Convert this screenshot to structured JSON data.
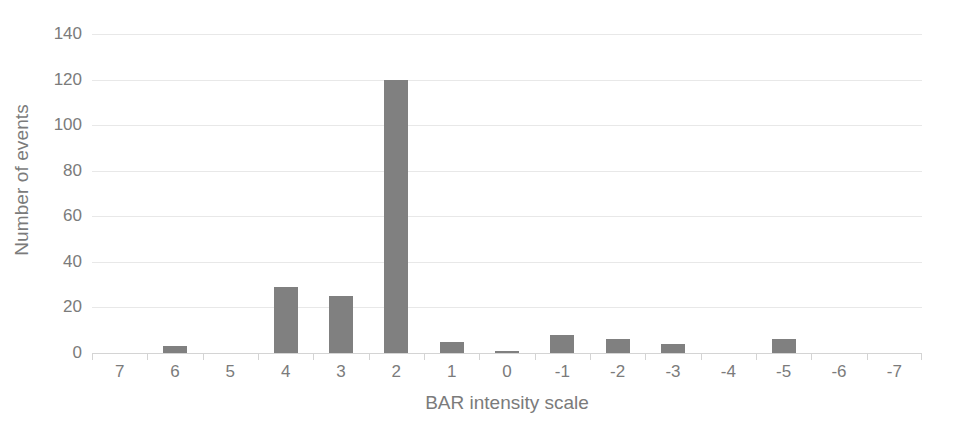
{
  "chart_data": {
    "type": "bar",
    "title": "",
    "xlabel": "BAR intensity scale",
    "ylabel": "Number of events",
    "categories": [
      "7",
      "6",
      "5",
      "4",
      "3",
      "2",
      "1",
      "0",
      "-1",
      "-2",
      "-3",
      "-4",
      "-5",
      "-6",
      "-7"
    ],
    "values": [
      0,
      3,
      0,
      29,
      25,
      120,
      5,
      1,
      8,
      6,
      4,
      0,
      6,
      0,
      0
    ],
    "ylim": [
      0,
      140
    ],
    "yticks": [
      0,
      20,
      40,
      60,
      80,
      100,
      120,
      140
    ],
    "ytick_labels": [
      "0",
      "20",
      "40",
      "60",
      "80",
      "100",
      "120",
      "140"
    ],
    "grid": true,
    "legend": false,
    "bar_color": "#808080",
    "gridline_color": "#e8e8e8",
    "text_color": "#7b7b7b",
    "background": "#ffffff"
  }
}
